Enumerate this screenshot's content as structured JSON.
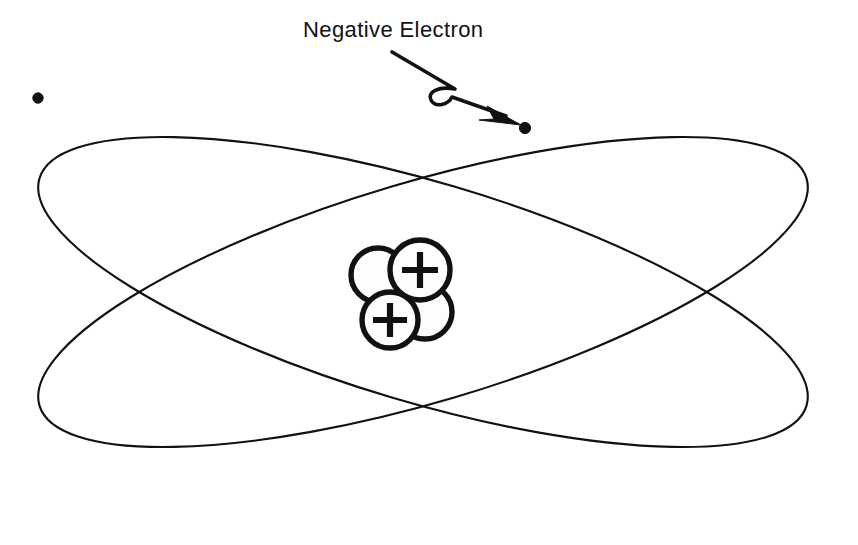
{
  "figure": {
    "background_color": "#ffffff",
    "ink_color": "#111111",
    "width": 858,
    "height": 545
  },
  "annotations": {
    "electron_label": "Negative Electron"
  },
  "orbits": [
    {
      "name": "orbit-descending",
      "cx": 423,
      "cy": 292,
      "rx": 400,
      "ry": 110,
      "rotation_deg": -16.5
    },
    {
      "name": "orbit-ascending",
      "cx": 423,
      "cy": 292,
      "rx": 400,
      "ry": 110,
      "rotation_deg": 16.5
    }
  ],
  "electrons": [
    {
      "name": "electron-left",
      "cx": 38,
      "cy": 98,
      "r": 5.2
    },
    {
      "name": "electron-right",
      "cx": 525,
      "cy": 128,
      "r": 5.6
    }
  ],
  "pointer": {
    "tail_x": 392,
    "tail_y": 52,
    "tip_x": 519,
    "tip_y": 124
  },
  "nucleus": {
    "label": "nucleus",
    "particles": [
      {
        "name": "neutron-upper-left",
        "cx": 378,
        "cy": 275,
        "r": 27,
        "charge": ""
      },
      {
        "name": "neutron-lower-right",
        "cx": 425,
        "cy": 312,
        "r": 27,
        "charge": ""
      },
      {
        "name": "proton-upper-right",
        "cx": 420,
        "cy": 270,
        "r": 30,
        "charge": "+"
      },
      {
        "name": "proton-lower-left",
        "cx": 390,
        "cy": 320,
        "r": 28,
        "charge": "+"
      }
    ]
  }
}
